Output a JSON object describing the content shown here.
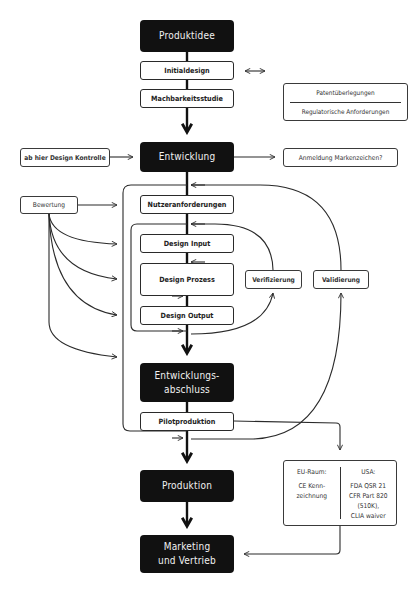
{
  "diagram": {
    "type": "process-flowchart",
    "main_flow": {
      "produktidee": "Produktidee",
      "initialdesign": "Initialdesign",
      "machbarkeitsstudie": "Machbarkeitsstudie",
      "entwicklung": "Entwicklung",
      "nutzeranforderungen": "Nutzeranforderungen",
      "design_input": "Design Input",
      "design_prozess": "Design Prozess",
      "design_output": "Design Output",
      "entwicklungsabschluss_line1": "Entwicklungs-",
      "entwicklungsabschluss_line2": "abschluss",
      "pilotproduktion": "Pilotproduktion",
      "produktion": "Produktion",
      "marketing_line1": "Marketing",
      "marketing_line2": "und Vertrieb"
    },
    "side_boxes": {
      "patent": "Patentüberlegungen",
      "regulatorisch": "Regulatorische Anforderungen",
      "design_kontrolle": "ab hier Design Kontrolle",
      "markenzeichen": "Anmeldung Markenzeichen?",
      "bewertung": "Bewertung",
      "verifizierung": "Verifizierung",
      "validierung": "Validierung"
    },
    "regulatory_box": {
      "eu_head": "EU-Raum:",
      "eu_line1": "CE Kenn-",
      "eu_line2": "zeichnung",
      "usa_head": "USA:",
      "usa_line1": "FDA QSR 21",
      "usa_line2": "CFR Part 820",
      "usa_line3": "(510K),",
      "usa_line4": "CLIA waiver"
    },
    "colors": {
      "dark_box": "#111111",
      "line": "#2a2a2a",
      "background": "#ffffff"
    }
  }
}
